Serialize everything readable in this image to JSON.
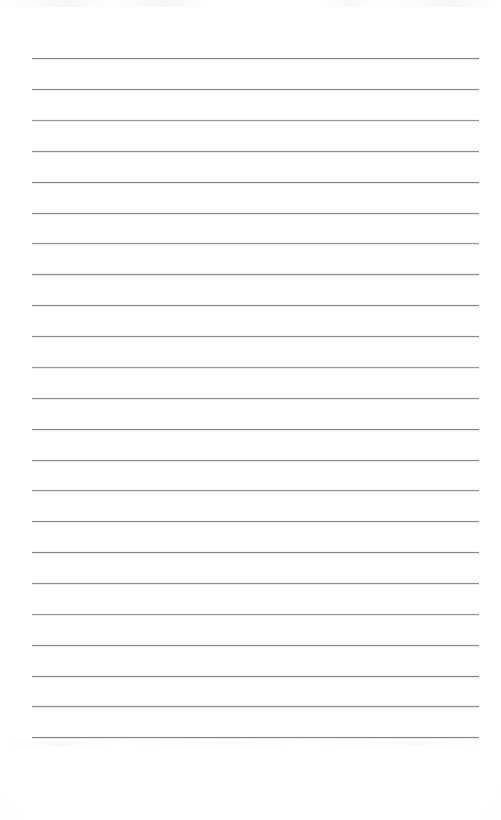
{
  "document": {
    "type": "lined-paper",
    "title": "Blank ruled notebook page",
    "page_width": 501,
    "page_height": 820,
    "background_color": "#fefefe",
    "content_text": "",
    "has_handwriting": false,
    "has_printed_text": false,
    "has_margin_line": false,
    "has_hole_punches": false
  },
  "ruling": {
    "line_color": "#8d8d92",
    "line_thickness_px": 1,
    "line_count": 23,
    "left_x": 32,
    "right_x": 479,
    "line_length_px": 447,
    "first_line_y": 58,
    "last_line_y": 737,
    "line_spacing_px": 30.8,
    "top_margin_px": 58,
    "bottom_margin_px": 83,
    "left_margin_px": 32,
    "right_margin_px": 22,
    "lines": [
      {
        "index": 1,
        "y": 58,
        "weight": "dark"
      },
      {
        "index": 2,
        "y": 89,
        "weight": "normal"
      },
      {
        "index": 3,
        "y": 120,
        "weight": "light"
      },
      {
        "index": 4,
        "y": 151,
        "weight": "normal"
      },
      {
        "index": 5,
        "y": 182,
        "weight": "dark"
      },
      {
        "index": 6,
        "y": 213,
        "weight": "normal"
      },
      {
        "index": 7,
        "y": 243,
        "weight": "light"
      },
      {
        "index": 8,
        "y": 274,
        "weight": "normal"
      },
      {
        "index": 9,
        "y": 305,
        "weight": "dark"
      },
      {
        "index": 10,
        "y": 336,
        "weight": "normal"
      },
      {
        "index": 11,
        "y": 367,
        "weight": "light"
      },
      {
        "index": 12,
        "y": 398,
        "weight": "normal"
      },
      {
        "index": 13,
        "y": 429,
        "weight": "dark"
      },
      {
        "index": 14,
        "y": 460,
        "weight": "normal"
      },
      {
        "index": 15,
        "y": 490,
        "weight": "light"
      },
      {
        "index": 16,
        "y": 521,
        "weight": "normal"
      },
      {
        "index": 17,
        "y": 552,
        "weight": "dark"
      },
      {
        "index": 18,
        "y": 583,
        "weight": "normal"
      },
      {
        "index": 19,
        "y": 614,
        "weight": "light"
      },
      {
        "index": 20,
        "y": 645,
        "weight": "normal"
      },
      {
        "index": 21,
        "y": 676,
        "weight": "dark"
      },
      {
        "index": 22,
        "y": 706,
        "weight": "normal"
      },
      {
        "index": 23,
        "y": 737,
        "weight": "dark"
      }
    ]
  }
}
